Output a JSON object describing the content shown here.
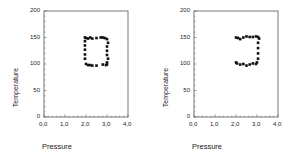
{
  "chart_data": [
    {
      "type": "scatter",
      "title": "",
      "xlabel": "Pressure",
      "ylabel": "Temperature",
      "xlim": [
        0,
        4
      ],
      "ylim": [
        0,
        200
      ],
      "xticks": [
        "0,0",
        "1,0",
        "2,0",
        "3,0",
        "4,0"
      ],
      "yticks": [
        "0",
        "50",
        "100",
        "150",
        "200"
      ],
      "grid": false,
      "legend": null,
      "series": [
        {
          "name": "closed loop",
          "x": [
            1.95,
            2.0,
            2.1,
            2.2,
            2.3,
            2.5,
            2.7,
            2.8,
            2.9,
            3.0,
            3.05,
            3.0,
            3.0,
            3.0,
            3.05,
            3.0,
            3.0,
            2.95,
            2.8,
            2.5,
            2.3,
            2.2,
            2.1,
            2.0,
            1.95,
            1.95,
            1.95,
            1.95,
            1.95
          ],
          "y": [
            150,
            149,
            148,
            150,
            148,
            149,
            150,
            150,
            149,
            147,
            140,
            133,
            125,
            117,
            110,
            103,
            99,
            98,
            99,
            97,
            97,
            98,
            98,
            100,
            110,
            118,
            127,
            135,
            143
          ]
        }
      ]
    },
    {
      "type": "scatter",
      "title": "",
      "xlabel": "Pressure",
      "ylabel": "Temperature",
      "xlim": [
        0,
        4
      ],
      "ylim": [
        0,
        200
      ],
      "xticks": [
        "0,0",
        "1,0",
        "2,0",
        "3,0",
        "4,0"
      ],
      "yticks": [
        "0",
        "50",
        "100",
        "150",
        "200"
      ],
      "grid": false,
      "legend": null,
      "series": [
        {
          "name": "open bracket",
          "x": [
            2.0,
            2.1,
            2.2,
            2.35,
            2.5,
            2.65,
            2.8,
            2.95,
            3.05,
            3.1,
            3.05,
            3.05,
            3.05,
            3.05,
            3.0,
            2.95,
            2.8,
            2.65,
            2.5,
            2.35,
            2.2,
            2.05,
            2.0
          ],
          "y": [
            150,
            149,
            147,
            150,
            152,
            151,
            151,
            152,
            151,
            148,
            140,
            130,
            120,
            110,
            103,
            100,
            101,
            99,
            97,
            100,
            99,
            101,
            103
          ]
        }
      ]
    }
  ]
}
